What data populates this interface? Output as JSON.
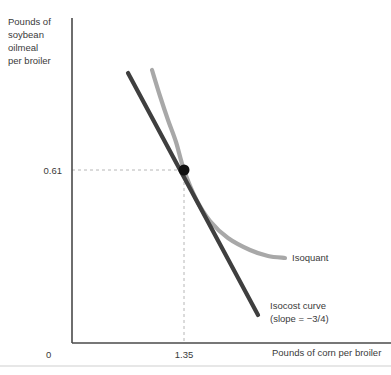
{
  "chart_data": {
    "type": "line",
    "title": "",
    "xlabel": "Pounds of corn per broiler",
    "ylabel": "Pounds of soybean oilmeal per broiler",
    "ylabel_lines": [
      "Pounds of",
      "soybean",
      "oilmeal",
      "per broiler"
    ],
    "origin_label": "0",
    "xticks": [
      "1.35"
    ],
    "yticks": [
      "0.61"
    ],
    "grid": false,
    "legend_position": "inline-right",
    "annotations": [
      {
        "name": "isoquant",
        "text": "Isoquant"
      },
      {
        "name": "isocost",
        "text_line1": "Isocost curve",
        "text_line2": "(slope = −3/4)"
      }
    ],
    "series": [
      {
        "name": "Isoquant",
        "label": "Isoquant",
        "color": "#a8a8a8",
        "shape": "convex-decreasing",
        "points": [
          [
            152,
            70
          ],
          [
            160,
            96
          ],
          [
            168,
            120
          ],
          [
            176,
            142
          ],
          [
            184,
            170
          ],
          [
            196,
            199
          ],
          [
            210,
            221
          ],
          [
            228,
            238
          ],
          [
            250,
            250
          ],
          [
            268,
            256
          ],
          [
            285,
            258
          ]
        ]
      },
      {
        "name": "Isocost curve",
        "label": "Isocost curve",
        "sublabel": "(slope = −3/4)",
        "color": "#3f3f3f",
        "slope": "-3/4",
        "shape": "straight-decreasing",
        "points": [
          [
            128,
            73
          ],
          [
            258,
            315
          ]
        ]
      }
    ],
    "tangency_point": {
      "name": "optimal-input-combination",
      "x_value": "1.35",
      "y_value": "0.61",
      "px": 184,
      "py": 170,
      "radius": 5.5,
      "color": "#111111"
    },
    "axes_geometry": {
      "x_axis_y": 343,
      "y_axis_x": 72,
      "y_axis_top": 18,
      "x_axis_right": 391
    }
  }
}
